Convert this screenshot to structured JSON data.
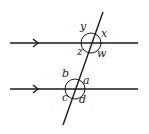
{
  "diagram": {
    "type": "parallel-lines-transversal",
    "colors": {
      "line": "#1a1a1a",
      "label": "#222222",
      "background": "#ffffff"
    },
    "parallel_lines": [
      {
        "name": "upper-line",
        "x1": 10,
        "y1": 43,
        "x2": 138,
        "y2": 43,
        "arrow_x": 37
      },
      {
        "name": "lower-line",
        "x1": 10,
        "y1": 89,
        "x2": 138,
        "y2": 89,
        "arrow_x": 37
      }
    ],
    "transversal": {
      "x1": 103,
      "y1": 12,
      "x2": 63,
      "y2": 125
    },
    "intersections": [
      {
        "name": "upper-intersection",
        "cx": 91,
        "cy": 43,
        "r": 10
      },
      {
        "name": "lower-intersection",
        "cx": 75,
        "cy": 89,
        "r": 10
      }
    ],
    "angle_labels": {
      "upper": {
        "y": {
          "text": "y",
          "x": 80,
          "y": 30
        },
        "x": {
          "text": "x",
          "x": 101,
          "y": 37
        },
        "z": {
          "text": "z",
          "x": 77,
          "y": 55
        },
        "w": {
          "text": "w",
          "x": 97,
          "y": 57
        }
      },
      "lower": {
        "b": {
          "text": "b",
          "x": 62,
          "y": 77
        },
        "a": {
          "text": "a",
          "x": 83,
          "y": 84
        },
        "c": {
          "text": "c",
          "x": 62,
          "y": 101
        },
        "d": {
          "text": "d",
          "x": 79,
          "y": 103
        }
      }
    }
  }
}
